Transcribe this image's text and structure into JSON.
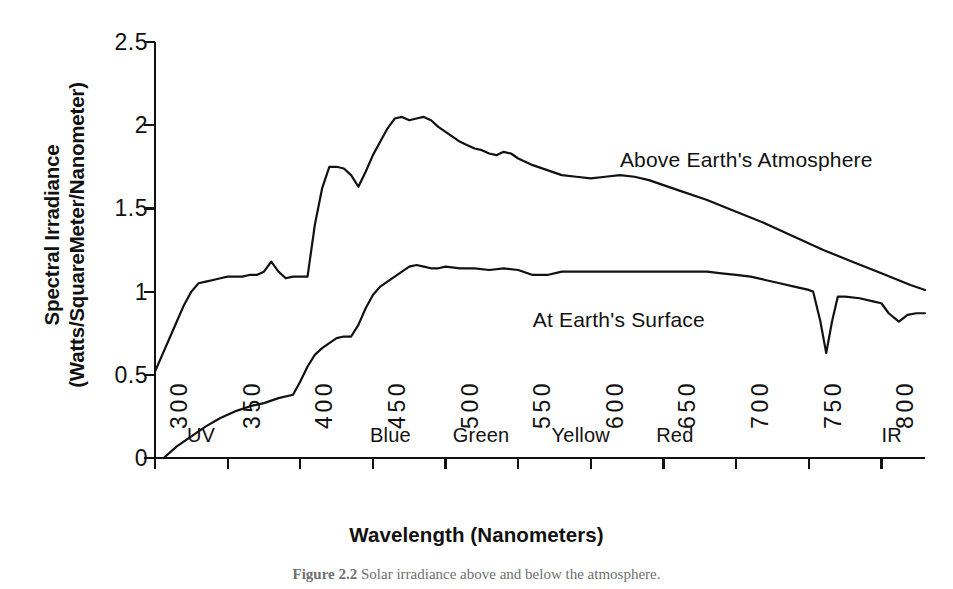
{
  "figure": {
    "caption_number": "Figure 2.2",
    "caption_text": "Solar irradiance above and below the atmosphere.",
    "background_color": "#ffffff",
    "ink_color": "#111111"
  },
  "chart_data": {
    "type": "line",
    "title": "",
    "xlabel": "Wavelength (Nanometers)",
    "ylabel_line1": "Spectral Irradiance",
    "ylabel_line2": "(Watts/SquareMeter/Nanometer)",
    "xlim": [
      300,
      830
    ],
    "ylim": [
      0,
      2.5
    ],
    "xticks": [
      300,
      350,
      400,
      450,
      500,
      550,
      600,
      650,
      700,
      750,
      800
    ],
    "xtick_labels": [
      "300",
      "350",
      "400",
      "450",
      "500",
      "550",
      "600",
      "650",
      "700",
      "750",
      "800"
    ],
    "yticks": [
      0,
      0.5,
      1,
      1.5,
      2,
      2.5
    ],
    "ytick_labels": [
      "0",
      "0.5",
      "1",
      "1.5",
      "2",
      "2.5"
    ],
    "grid": false,
    "legend_position": "inline-annotations",
    "xtick_label_rotation": 90,
    "series": [
      {
        "name": "Above Earth's Atmosphere",
        "annotation_label": "Above Earth's Atmosphere",
        "color": "#111111",
        "x": [
          300,
          305,
          310,
          315,
          320,
          325,
          330,
          335,
          340,
          345,
          350,
          355,
          360,
          365,
          370,
          375,
          380,
          385,
          390,
          395,
          400,
          405,
          410,
          415,
          420,
          425,
          430,
          435,
          440,
          445,
          450,
          455,
          460,
          465,
          470,
          475,
          480,
          485,
          490,
          495,
          500,
          505,
          510,
          515,
          520,
          525,
          530,
          535,
          540,
          545,
          550,
          560,
          570,
          580,
          590,
          600,
          610,
          620,
          630,
          640,
          650,
          660,
          680,
          700,
          720,
          740,
          760,
          780,
          800,
          820,
          830
        ],
        "y": [
          0.52,
          0.62,
          0.72,
          0.82,
          0.92,
          1.0,
          1.05,
          1.06,
          1.07,
          1.08,
          1.09,
          1.09,
          1.09,
          1.1,
          1.1,
          1.12,
          1.18,
          1.12,
          1.08,
          1.09,
          1.09,
          1.09,
          1.4,
          1.62,
          1.75,
          1.75,
          1.74,
          1.7,
          1.63,
          1.72,
          1.82,
          1.9,
          1.98,
          2.04,
          2.05,
          2.03,
          2.04,
          2.05,
          2.03,
          1.99,
          1.96,
          1.93,
          1.9,
          1.88,
          1.86,
          1.85,
          1.83,
          1.82,
          1.84,
          1.83,
          1.8,
          1.76,
          1.73,
          1.7,
          1.69,
          1.68,
          1.69,
          1.7,
          1.69,
          1.67,
          1.64,
          1.61,
          1.55,
          1.48,
          1.41,
          1.33,
          1.25,
          1.18,
          1.11,
          1.04,
          1.01
        ]
      },
      {
        "name": "At Earth's Surface",
        "annotation_label": "At Earth's Surface",
        "color": "#111111",
        "x": [
          306,
          315,
          325,
          335,
          345,
          355,
          365,
          375,
          385,
          395,
          400,
          405,
          410,
          415,
          420,
          425,
          430,
          435,
          440,
          445,
          450,
          455,
          460,
          465,
          470,
          475,
          480,
          485,
          490,
          495,
          500,
          510,
          520,
          530,
          540,
          550,
          560,
          570,
          580,
          590,
          600,
          610,
          620,
          630,
          640,
          650,
          660,
          670,
          680,
          690,
          700,
          710,
          720,
          730,
          740,
          750,
          753,
          758,
          762,
          766,
          770,
          775,
          785,
          795,
          800,
          805,
          812,
          818,
          824,
          830
        ],
        "y": [
          0.0,
          0.07,
          0.13,
          0.19,
          0.24,
          0.28,
          0.31,
          0.33,
          0.36,
          0.38,
          0.46,
          0.55,
          0.62,
          0.66,
          0.69,
          0.72,
          0.73,
          0.73,
          0.8,
          0.9,
          0.98,
          1.03,
          1.06,
          1.09,
          1.12,
          1.15,
          1.16,
          1.15,
          1.14,
          1.14,
          1.15,
          1.14,
          1.14,
          1.13,
          1.14,
          1.13,
          1.1,
          1.1,
          1.12,
          1.12,
          1.12,
          1.12,
          1.12,
          1.12,
          1.12,
          1.12,
          1.12,
          1.12,
          1.12,
          1.11,
          1.1,
          1.09,
          1.07,
          1.05,
          1.03,
          1.01,
          1.0,
          0.82,
          0.63,
          0.82,
          0.97,
          0.97,
          0.96,
          0.94,
          0.93,
          0.87,
          0.82,
          0.86,
          0.87,
          0.87
        ]
      }
    ],
    "band_labels": [
      {
        "text": "UV",
        "wavelength": 322,
        "value": 0.12
      },
      {
        "text": "Blue",
        "wavelength": 448,
        "value": 0.12
      },
      {
        "text": "Green",
        "wavelength": 505,
        "value": 0.12
      },
      {
        "text": "Yellow",
        "wavelength": 573,
        "value": 0.12
      },
      {
        "text": "Red",
        "wavelength": 645,
        "value": 0.12
      },
      {
        "text": "IR",
        "wavelength": 800,
        "value": 0.12
      }
    ],
    "annotations": [
      {
        "text": "Above Earth's Atmosphere",
        "wavelength": 620,
        "value": 1.78
      },
      {
        "text": "At Earth's Surface",
        "wavelength": 560,
        "value": 0.82
      }
    ]
  }
}
